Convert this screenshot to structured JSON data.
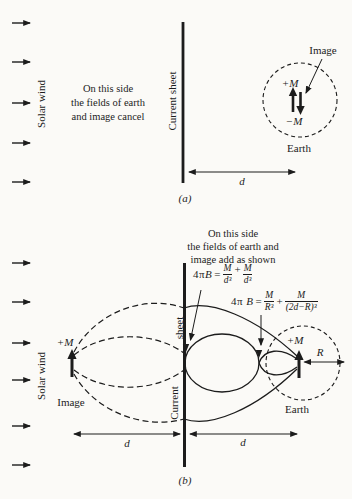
{
  "colors": {
    "ink": "#1c1c1c",
    "paper": "#fbfaf7"
  },
  "panel_a": {
    "caption": "(a)",
    "solar_wind": "Solar wind",
    "current_sheet": "Current sheet",
    "note_lines": [
      "On this side",
      "the fields of earth",
      "and image cancel"
    ],
    "image_label": "Image",
    "earth_label": "Earth",
    "earth_moment": "+M",
    "image_moment": "−M",
    "distance": "d"
  },
  "panel_b": {
    "caption": "(b)",
    "solar_wind": "Solar wind",
    "current_sheet_word_top": "sheet",
    "current_sheet_word_bottom": "Current",
    "note_lines": [
      "On this side",
      "the fields of earth and",
      "image add as shown"
    ],
    "image_label": "Image",
    "earth_label": "Earth",
    "image_moment": "+M",
    "earth_moment": "+M",
    "radius": "R",
    "distance_left": "d",
    "distance_right": "d",
    "eq1": {
      "prefix": "4π",
      "var": "B",
      "equals": "=",
      "num1": "M",
      "den1": "d³",
      "plus": "+",
      "num2": "M",
      "den2": "d³"
    },
    "eq2": {
      "prefix": "4π",
      "var": "B",
      "equals": "=",
      "num1": "M",
      "den1": "R³",
      "plus": "+",
      "num2": "M",
      "den2": "(2d−R)³"
    }
  }
}
